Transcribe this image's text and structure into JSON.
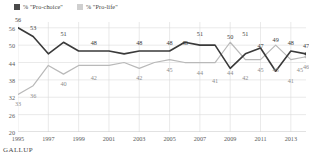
{
  "legend": {
    "items": [
      {
        "label": "% \"Pro-choice\"",
        "color": "#4a4a4a",
        "key": "pro_choice"
      },
      {
        "label": "% \"Pro-life\"",
        "color": "#cfcfcf",
        "key": "pro_life"
      }
    ]
  },
  "footer": {
    "source": "GALLUP"
  },
  "chart_data": {
    "type": "line",
    "title": "",
    "xlabel": "",
    "ylabel": "",
    "ylim": [
      20,
      58
    ],
    "yticks": [
      20,
      26,
      32,
      38,
      44,
      50,
      56
    ],
    "xlim": [
      1995,
      2014
    ],
    "xticks": [
      1995,
      1997,
      1999,
      2001,
      2003,
      2005,
      2007,
      2009,
      2011,
      2013
    ],
    "grid": true,
    "legend_position": "top-left",
    "x": [
      1995,
      1996,
      1997,
      1998,
      1999,
      2000,
      2001,
      2002,
      2003,
      2004,
      2005,
      2006,
      2007,
      2008,
      2009,
      2010,
      2011,
      2012,
      2013,
      2014
    ],
    "series": [
      {
        "name": "% \"Pro-choice\"",
        "color": "#3a3a3a",
        "values": [
          56,
          53,
          47,
          51,
          48,
          48,
          48,
          47,
          48,
          48,
          48,
          51,
          50,
          50,
          42,
          47,
          49,
          41,
          48,
          47
        ],
        "labels": [
          {
            "x": 1995,
            "y": 56,
            "text": "56"
          },
          {
            "x": 1996,
            "y": 53,
            "text": "53"
          },
          {
            "x": 1998,
            "y": 51,
            "text": "51"
          },
          {
            "x": 2000,
            "y": 48,
            "text": "48"
          },
          {
            "x": 2003,
            "y": 48,
            "text": "48"
          },
          {
            "x": 2005,
            "y": 48,
            "text": "48"
          },
          {
            "x": 2006,
            "y": 48,
            "text": "48"
          },
          {
            "x": 2007,
            "y": 51,
            "text": "51"
          },
          {
            "x": 2009,
            "y": 50,
            "text": "50"
          },
          {
            "x": 2010,
            "y": 51,
            "text": "51"
          },
          {
            "x": 2011,
            "y": 47,
            "text": "47"
          },
          {
            "x": 2012,
            "y": 49,
            "text": "49"
          },
          {
            "x": 2013,
            "y": 48,
            "text": "48"
          },
          {
            "x": 2014,
            "y": 47,
            "text": "47"
          }
        ]
      },
      {
        "name": "% \"Pro-life\"",
        "color": "#b9b9b9",
        "values": [
          33,
          36,
          43,
          40,
          43,
          43,
          43,
          44,
          42,
          44,
          45,
          44,
          44,
          44,
          51,
          45,
          45,
          50,
          45,
          46
        ],
        "labels": [
          {
            "x": 1995,
            "y": 33,
            "text": "33"
          },
          {
            "x": 1996,
            "y": 36,
            "text": "36"
          },
          {
            "x": 1998,
            "y": 40,
            "text": "40"
          },
          {
            "x": 2000,
            "y": 42,
            "text": "42"
          },
          {
            "x": 2003,
            "y": 42,
            "text": "42"
          },
          {
            "x": 2005,
            "y": 45,
            "text": "45"
          },
          {
            "x": 2007,
            "y": 44,
            "text": "44"
          },
          {
            "x": 2008,
            "y": 41,
            "text": "41"
          },
          {
            "x": 2009,
            "y": 44,
            "text": "44"
          },
          {
            "x": 2010,
            "y": 42,
            "text": "42"
          },
          {
            "x": 2011,
            "y": 45,
            "text": "45"
          },
          {
            "x": 2012,
            "y": 45,
            "text": "45"
          },
          {
            "x": 2013,
            "y": 41,
            "text": "41"
          },
          {
            "x": 2013.6,
            "y": 45,
            "text": "45"
          },
          {
            "x": 2014,
            "y": 46,
            "text": "46"
          }
        ]
      }
    ]
  }
}
